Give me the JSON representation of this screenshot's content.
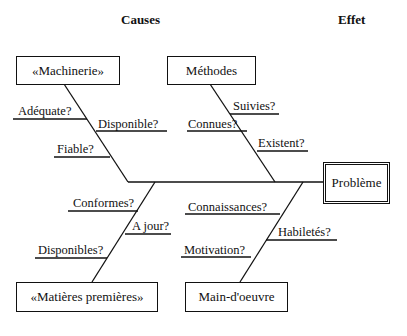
{
  "headers": {
    "causes": "Causes",
    "effect": "Effet"
  },
  "effect": {
    "label": "Problème"
  },
  "categories": [
    {
      "label": "«Machinerie»",
      "causes": [
        "Adéquate?",
        "Disponible?",
        "Fiable?"
      ]
    },
    {
      "label": "Méthodes",
      "causes": [
        "Suivies?",
        "Connues?",
        "Existent?"
      ]
    },
    {
      "label": "«Matières premières»",
      "causes": [
        "Conformes?",
        "A jour?",
        "Disponibles?"
      ]
    },
    {
      "label": "Main-d'oeuvre",
      "causes": [
        "Connaissances?",
        "Habiletés?",
        "Motivation?"
      ]
    }
  ],
  "colors": {
    "line": "#111111",
    "background": "#ffffff"
  }
}
